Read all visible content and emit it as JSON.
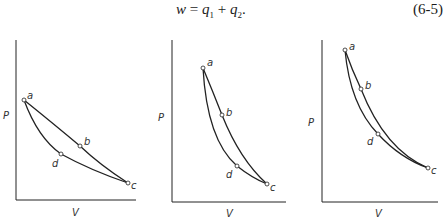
{
  "equation": {
    "lhs": "w",
    "equals": "=",
    "term1_var": "q",
    "term1_sub": "1",
    "plus": "+",
    "term2_var": "q",
    "term2_sub": "2",
    "end": ".",
    "number": "(6-5)"
  },
  "panels": [
    {
      "y_axis_label": "P",
      "x_axis_label": "V",
      "points": [
        {
          "id": "a",
          "label": "a"
        },
        {
          "id": "b",
          "label": "b"
        },
        {
          "id": "c",
          "label": "c"
        },
        {
          "id": "d",
          "label": "d"
        }
      ],
      "paths": [
        "a-b-c",
        "a-d-c"
      ]
    },
    {
      "y_axis_label": "P",
      "x_axis_label": "V",
      "points": [
        {
          "id": "a",
          "label": "a"
        },
        {
          "id": "b",
          "label": "b"
        },
        {
          "id": "c",
          "label": "c"
        },
        {
          "id": "d",
          "label": "d"
        }
      ],
      "paths": [
        "a-b-c",
        "a-d-c"
      ]
    },
    {
      "y_axis_label": "P",
      "x_axis_label": "V",
      "points": [
        {
          "id": "a",
          "label": "a"
        },
        {
          "id": "b",
          "label": "b"
        },
        {
          "id": "c",
          "label": "c"
        },
        {
          "id": "d",
          "label": "d"
        }
      ],
      "paths": [
        "a-b-c",
        "a-d-c"
      ]
    }
  ]
}
